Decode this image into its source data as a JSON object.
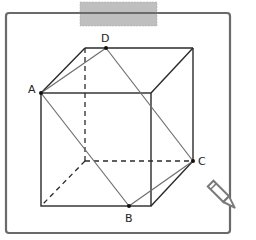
{
  "figure": {
    "type": "cube-with-section",
    "labels": {
      "A": "A",
      "B": "B",
      "C": "C",
      "D": "D"
    },
    "colors": {
      "frame": "#6a6a6a",
      "edges": "#2a2a2a",
      "section": "#6e6e6e",
      "tape": "#b4b4b4",
      "pencil": "#7a7a7a"
    }
  },
  "decorations": {
    "tape": "masking-tape",
    "pencil": "pencil-icon"
  }
}
